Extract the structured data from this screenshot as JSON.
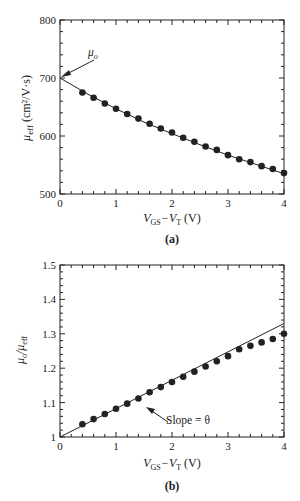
{
  "chart_data": [
    {
      "type": "line",
      "panel": "(a)",
      "xlabel": "V_GS−V_T (V)",
      "ylabel": "μ_eff (cm²/V·s)",
      "xlim": [
        0,
        4
      ],
      "ylim": [
        500,
        800
      ],
      "x_ticks": [
        0,
        1,
        2,
        3,
        4
      ],
      "y_ticks": [
        500,
        600,
        700,
        800
      ],
      "annotation": "μo",
      "annotation_target": [
        0,
        700
      ],
      "series": [
        {
          "name": "measured",
          "style": "markers",
          "x": [
            0.4,
            0.6,
            0.8,
            1.0,
            1.2,
            1.4,
            1.6,
            1.8,
            2.0,
            2.2,
            2.4,
            2.6,
            2.8,
            3.0,
            3.2,
            3.4,
            3.6,
            3.8,
            4.0
          ],
          "values": [
            675,
            666,
            656,
            647,
            638,
            630,
            621,
            613,
            606,
            597,
            590,
            582,
            576,
            567,
            560,
            555,
            548,
            543,
            536
          ]
        },
        {
          "name": "fit",
          "style": "line",
          "x": [
            0,
            0.5,
            1,
            1.5,
            2,
            2.5,
            3,
            3.5,
            4
          ],
          "values": [
            700,
            672,
            647,
            624,
            604,
            585,
            567,
            551,
            535
          ]
        }
      ]
    },
    {
      "type": "scatter",
      "panel": "(b)",
      "xlabel": "V_GS−V_T (V)",
      "ylabel": "μo/μ_eff",
      "xlim": [
        0,
        4
      ],
      "ylim": [
        1.0,
        1.5
      ],
      "x_ticks": [
        0,
        1,
        2,
        3,
        4
      ],
      "y_ticks": [
        1,
        1.1,
        1.2,
        1.3,
        1.4,
        1.5
      ],
      "annotation": "Slope = θ",
      "series": [
        {
          "name": "measured",
          "style": "markers",
          "x": [
            0.4,
            0.6,
            0.8,
            1.0,
            1.2,
            1.4,
            1.6,
            1.8,
            2.0,
            2.2,
            2.4,
            2.6,
            2.8,
            3.0,
            3.2,
            3.4,
            3.6,
            3.8,
            4.0
          ],
          "values": [
            1.037,
            1.052,
            1.067,
            1.082,
            1.097,
            1.112,
            1.13,
            1.145,
            1.16,
            1.175,
            1.19,
            1.205,
            1.22,
            1.235,
            1.255,
            1.265,
            1.275,
            1.285,
            1.3
          ]
        },
        {
          "name": "linear fit",
          "style": "line",
          "x": [
            0,
            4
          ],
          "values": [
            1.0,
            1.33
          ]
        }
      ]
    }
  ],
  "labels": {
    "a": {
      "yticks": [
        "800",
        "700",
        "600",
        "500"
      ],
      "xticks": [
        "0",
        "1",
        "2",
        "3",
        "4"
      ],
      "xlabel_main": "V",
      "xlabel_sub1": "GS",
      "xlabel_mid": "−V",
      "xlabel_sub2": "T",
      "xlabel_unit": " (V)",
      "ylabel_main": "μ",
      "ylabel_sub": "eff",
      "ylabel_unit": " (cm²/V·s)",
      "annotation_main": "μ",
      "annotation_sub": "o",
      "panel": "(a)"
    },
    "b": {
      "yticks": [
        "1.5",
        "1.4",
        "1.3",
        "1.2",
        "1.1",
        "1"
      ],
      "xticks": [
        "0",
        "1",
        "2",
        "3",
        "4"
      ],
      "xlabel_main": "V",
      "xlabel_sub1": "GS",
      "xlabel_mid": "−V",
      "xlabel_sub2": "T",
      "xlabel_unit": " (V)",
      "ylabel_main1": "μ",
      "ylabel_sub1": "o",
      "ylabel_slash": "/μ",
      "ylabel_sub2": "eff",
      "annotation": "Slope = θ",
      "panel": "(b)"
    }
  }
}
